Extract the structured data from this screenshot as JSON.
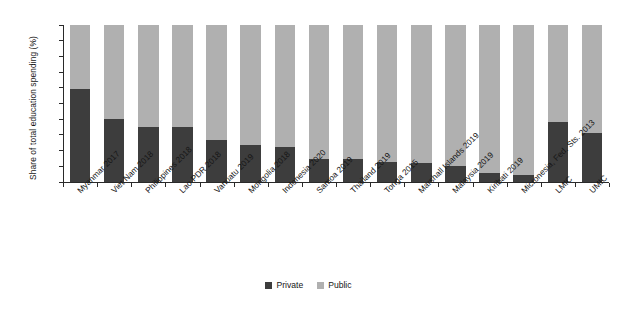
{
  "chart_data": {
    "type": "bar",
    "subtype": "stacked-100-percent",
    "title": "",
    "xlabel": "",
    "ylabel": "Share of total education spending (%)",
    "ylim": [
      0,
      100
    ],
    "yticks": [
      0,
      10,
      20,
      30,
      40,
      50,
      60,
      70,
      80,
      90,
      100
    ],
    "grid": false,
    "legend_position": "bottom-center",
    "categories": [
      "Myanmar 2017",
      "Viet Nam 2018",
      "Philippines 2018",
      "Lao PDR 2018",
      "Vanuatu 2019",
      "Mongolia 2018",
      "Indonesia 2020",
      "Samoa 2019",
      "Thailand 2019",
      "Tonga 2015",
      "Marshall Islands 2019",
      "Malaysia 2019",
      "Kiribati 2019",
      "Micronesia, Fed. Sts. 2013",
      "LMIC",
      "UMIC"
    ],
    "series": [
      {
        "name": "Private",
        "color": "#3d3d3d",
        "values": [
          59,
          40,
          35,
          35,
          26.5,
          23.5,
          22,
          14.5,
          14.5,
          12.5,
          12,
          10,
          6,
          4.5,
          38,
          31
        ]
      },
      {
        "name": "Public",
        "color": "#b0b0b0",
        "values": [
          41,
          60,
          65,
          65,
          73.5,
          76.5,
          78,
          85.5,
          85.5,
          87.5,
          88,
          90,
          94,
          95.5,
          62,
          69
        ]
      }
    ]
  },
  "legend": {
    "items": [
      {
        "label": "Private",
        "color": "#3d3d3d"
      },
      {
        "label": "Public",
        "color": "#b0b0b0"
      }
    ]
  }
}
